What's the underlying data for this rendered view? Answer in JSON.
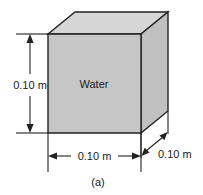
{
  "figure": {
    "caption": "(a)",
    "object_label": "Water",
    "dimensions": {
      "height_label": "0.10 m",
      "width_label": "0.10 m",
      "depth_label": "0.10 m"
    },
    "colors": {
      "front_face": "#c6c6c6",
      "top_face": "#d6d6d6",
      "right_face": "#c0c0c0",
      "outline": "#222222",
      "text": "#1a1a1a",
      "background": "#ffffff"
    },
    "geometry": {
      "shape": "cube",
      "front_face_points": "48,34 141,34 141,133 48,133",
      "top_face_points": "48,34 75,12 168,12 141,34",
      "right_face_points": "141,34 168,12 168,111 141,133"
    }
  }
}
